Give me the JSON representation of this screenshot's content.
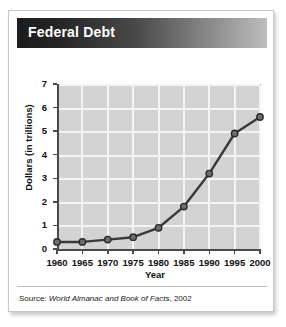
{
  "card": {
    "title": "Federal Debt",
    "source_prefix": "Source:",
    "source_title": "World Almanac and Book of Facts",
    "source_year": ", 2002"
  },
  "colors": {
    "title_bar_dark": "#1c1c1c",
    "title_bar_light": "#bdbdbd",
    "title_text": "#ffffff",
    "plot_background": "#d3d3d3",
    "gridline": "#f4f4f4",
    "axis": "#4a4a4a",
    "series_line": "#3a3a3a",
    "marker_fill": "#6e6e6e",
    "marker_edge": "#2b2b2b",
    "card_border": "#c8c8c8"
  },
  "chart_data": {
    "type": "line",
    "title": "Federal Debt",
    "xlabel": "Year",
    "ylabel": "Dollars (in trillions)",
    "x": [
      1960,
      1965,
      1970,
      1975,
      1980,
      1985,
      1990,
      1995,
      2000
    ],
    "xtick_labels": [
      "1960",
      "1965",
      "1970",
      "1975",
      "1980",
      "1985",
      "1990",
      "1995",
      "2000"
    ],
    "ytick_labels": [
      "0",
      "1",
      "2",
      "3",
      "4",
      "5",
      "6",
      "7"
    ],
    "yticks": [
      0,
      1,
      2,
      3,
      4,
      5,
      6,
      7
    ],
    "values": [
      0.3,
      0.3,
      0.4,
      0.5,
      0.9,
      1.8,
      3.2,
      4.9,
      5.6
    ],
    "series": [
      {
        "name": "Federal Debt",
        "values": [
          0.3,
          0.3,
          0.4,
          0.5,
          0.9,
          1.8,
          3.2,
          4.9,
          5.6
        ]
      }
    ],
    "xlim": [
      1960,
      2000
    ],
    "ylim": [
      0,
      7
    ],
    "grid": true,
    "legend": "none",
    "marker": "circle"
  }
}
